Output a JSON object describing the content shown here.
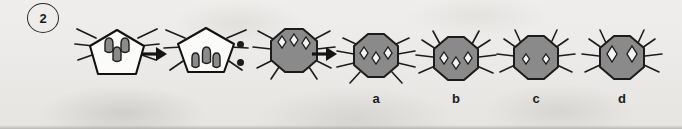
{
  "question": {
    "number": "2",
    "badge_shape": "circle"
  },
  "colors": {
    "ink": "#1b1b1b",
    "outline": "#1c1c1c",
    "body_gray": "#8a8a8a",
    "body_gray_dark_edge": "#6e6e6e",
    "marking_dark": "#6e6e6e",
    "marking_light": "#f2f1ef",
    "paper": "#ecebe9"
  },
  "sequence": {
    "items": [
      {
        "key": "term1",
        "icon_name": "white-pentagon-bug-three-top-markings",
        "body": "pentagon",
        "fill": "white",
        "markings": 3,
        "marking_shape": "rounded-teardrop",
        "marking_position": "top",
        "legs": 6
      },
      {
        "key": "arrow1",
        "icon_name": "right-arrow-icon",
        "glyph": "→"
      },
      {
        "key": "term2",
        "icon_name": "white-pentagon-bug-three-bottom-markings",
        "body": "pentagon",
        "fill": "white",
        "markings": 3,
        "marking_shape": "rounded-teardrop",
        "marking_position": "bottom",
        "legs": 6
      },
      {
        "key": "ratio",
        "icon_name": "colon-separator-icon",
        "glyph": ":"
      },
      {
        "key": "term3",
        "icon_name": "gray-octagon-bug-three-diamond-markings",
        "body": "octagon",
        "fill": "gray",
        "markings": 3,
        "marking_shape": "diamond",
        "marking_position": "top-arc",
        "legs": 6
      },
      {
        "key": "arrow2",
        "icon_name": "right-arrow-icon",
        "glyph": "→"
      },
      {
        "key": "answer-slot",
        "icon_name": "answer-placeholder"
      }
    ]
  },
  "options": [
    {
      "id": "a",
      "label": "a",
      "icon_name": "gray-octagon-bug-option-a",
      "body": "octagon",
      "fill": "gray",
      "markings": 3,
      "marking_shape": "diamond",
      "marking_layout": "middle-lower",
      "legs": 6
    },
    {
      "id": "b",
      "label": "b",
      "icon_name": "gray-octagon-bug-option-b",
      "body": "octagon",
      "fill": "gray",
      "markings": 3,
      "marking_shape": "diamond",
      "marking_layout": "middle-lower-shifted-down",
      "legs": 6
    },
    {
      "id": "c",
      "label": "c",
      "icon_name": "gray-octagon-bug-option-c",
      "body": "octagon",
      "fill": "gray",
      "markings": 2,
      "marking_shape": "diamond",
      "marking_layout": "pair-small",
      "legs": 6
    },
    {
      "id": "d",
      "label": "d",
      "icon_name": "gray-octagon-bug-option-d",
      "body": "octagon",
      "fill": "gray",
      "markings": 2,
      "marking_shape": "diamond",
      "marking_layout": "pair-large",
      "legs": 6
    }
  ]
}
